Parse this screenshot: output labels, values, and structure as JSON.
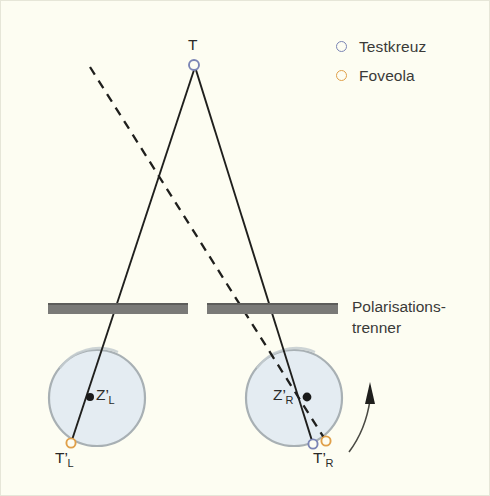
{
  "figure": {
    "background_color": "#fdfdf2",
    "width": 490,
    "height": 496
  },
  "legend": {
    "items": [
      {
        "label": "Testkreuz",
        "marker": "open-circle",
        "color": "#7b85b5"
      },
      {
        "label": "Foveola",
        "marker": "open-circle",
        "color": "#e0a04a"
      }
    ]
  },
  "caption": {
    "line1": "Polarisations-",
    "line2": "trenner"
  },
  "labels": {
    "target": {
      "text": "T",
      "sub": ""
    },
    "left_center": {
      "text": "Z",
      "prime": "’",
      "sub": "L"
    },
    "right_center": {
      "text": "Z",
      "prime": "’",
      "sub": "R"
    },
    "left_image": {
      "text": "T",
      "prime": "’",
      "sub": "L"
    },
    "right_image": {
      "text": "T",
      "prime": "’",
      "sub": "R"
    }
  },
  "diagram": {
    "target_point": {
      "x": 194,
      "y": 65,
      "color": "#7b85b5"
    },
    "polarizer_bars": [
      {
        "x": 48,
        "y": 303,
        "width": 140,
        "height": 11,
        "color": "#7a7a78"
      },
      {
        "x": 207,
        "y": 303,
        "width": 131,
        "height": 11,
        "color": "#7a7a78"
      }
    ],
    "eyes": [
      {
        "name": "left-eye",
        "cx": 97,
        "cy": 398,
        "r": 48,
        "fill": "#e4ecf2",
        "stroke": "#a8b0b4"
      },
      {
        "name": "right-eye",
        "cx": 294,
        "cy": 398,
        "r": 48,
        "fill": "#e4ecf2",
        "stroke": "#a8b0b4"
      }
    ],
    "nodal_points": [
      {
        "name": "ZL",
        "x": 90,
        "y": 397,
        "color": "#1a1a1a"
      },
      {
        "name": "ZR",
        "x": 307,
        "y": 397,
        "color": "#1a1a1a"
      }
    ],
    "image_points": [
      {
        "name": "TL-foveola",
        "x": 71,
        "y": 443,
        "color": "#e0a04a"
      },
      {
        "name": "TR-testkreuz",
        "x": 313,
        "y": 444,
        "color": "#7b85b5"
      },
      {
        "name": "TR-foveola",
        "x": 326,
        "y": 441,
        "color": "#e0a04a"
      }
    ],
    "solid_rays": [
      {
        "name": "ray-to-left-eye",
        "x1": 194,
        "y1": 69,
        "x2": 71,
        "y2": 443
      },
      {
        "name": "ray-to-right-eye",
        "x1": 196,
        "y1": 69,
        "x2": 313,
        "y2": 444
      }
    ],
    "dashed_ray": {
      "name": "visual-axis-right-eye",
      "x1": 90,
      "y1": 67,
      "x2": 326,
      "y2": 441
    },
    "rotation_arrow": {
      "name": "rotation-arrow",
      "path": "M 349 449 C 357 438 366 420 370 395",
      "color": "#4a4a44"
    }
  }
}
